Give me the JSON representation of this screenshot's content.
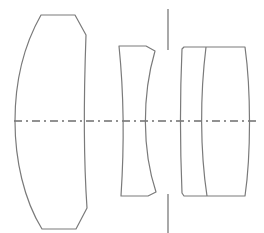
{
  "diagram": {
    "type": "optical-lens-cross-section",
    "elements": [
      {
        "id": "element-1",
        "kind": "positive meniscus / biconvex front element"
      },
      {
        "id": "element-2",
        "kind": "negative biconcave element"
      },
      {
        "id": "aperture-stop",
        "kind": "aperture stop"
      },
      {
        "id": "element-3-4",
        "kind": "cemented doublet (two elements)"
      }
    ],
    "optical_axis": "dash-dot line",
    "colors": {
      "stroke": "#7a7a7a",
      "background": "#ffffff"
    }
  }
}
